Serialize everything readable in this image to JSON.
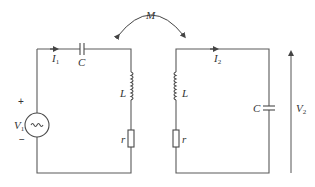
{
  "diagram": {
    "type": "coupled-circuit",
    "mutual_inductance": {
      "label": "M"
    },
    "primary": {
      "source": {
        "label": "V",
        "subscript": "1",
        "plus": "+",
        "minus": "−",
        "symbol": "~"
      },
      "current": {
        "label": "I",
        "subscript": "1"
      },
      "capacitor": {
        "label": "C"
      },
      "inductor": {
        "label": "L"
      },
      "resistor": {
        "label": "r"
      }
    },
    "secondary": {
      "current": {
        "label": "I",
        "subscript": "2"
      },
      "inductor": {
        "label": "L"
      },
      "resistor": {
        "label": "r"
      },
      "capacitor": {
        "label": "C"
      },
      "output_voltage": {
        "label": "V",
        "subscript": "2"
      }
    },
    "colors": {
      "wire": "#5a5a5a",
      "text": "#333333"
    }
  }
}
